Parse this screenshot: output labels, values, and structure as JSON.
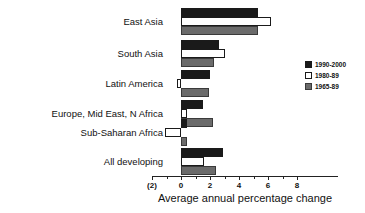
{
  "chart_data": {
    "type": "bar",
    "orientation": "horizontal",
    "title": "",
    "xlabel": "Average annual percentage change",
    "ylabel": "",
    "xlim": [
      -2,
      8
    ],
    "xticks": [
      -2,
      0,
      2,
      4,
      6,
      8
    ],
    "xtick_labels": [
      "(2)",
      "0",
      "2",
      "4",
      "6",
      "8"
    ],
    "grid": false,
    "legend_position": "right",
    "categories": [
      "East Asia",
      "South Asia",
      "Latin America",
      "Europe, Mid East, N Africa",
      "Sub-Saharan Africa",
      "All developing"
    ],
    "series": [
      {
        "name": "1990-2000",
        "color": "#1a1a1a",
        "swatch": "black",
        "values": [
          5.3,
          2.6,
          2.0,
          1.5,
          0.4,
          2.9
        ]
      },
      {
        "name": "1980-89",
        "color": "#ffffff",
        "swatch": "white",
        "values": [
          6.2,
          3.0,
          -0.25,
          0.4,
          -1.1,
          1.6
        ]
      },
      {
        "name": "1965-89",
        "color": "#6b6b6b",
        "swatch": "gray",
        "values": [
          5.3,
          2.3,
          1.9,
          2.2,
          0.4,
          2.4
        ]
      }
    ]
  }
}
